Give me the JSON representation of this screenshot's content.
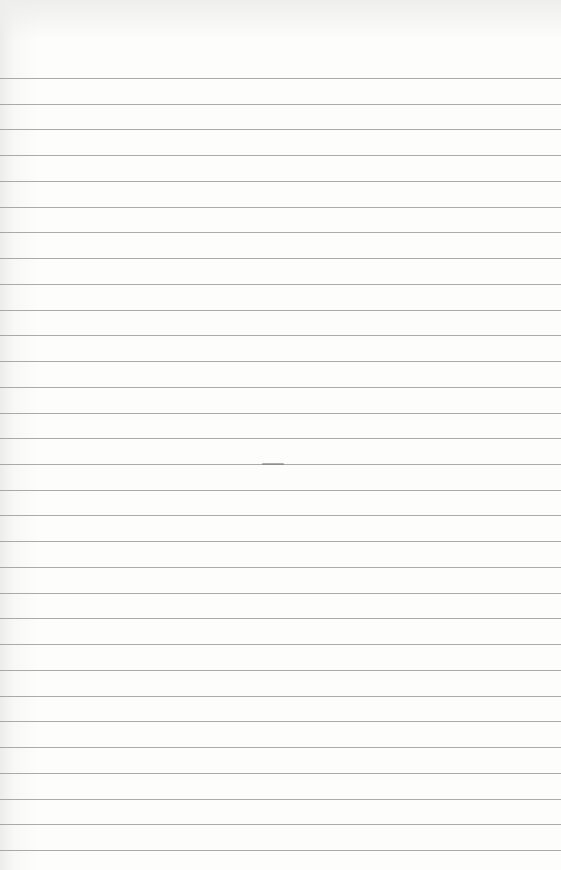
{
  "page": {
    "rule_count": 31,
    "rule_color": "#8f8f8f",
    "paper_color": "#fdfdfc"
  }
}
